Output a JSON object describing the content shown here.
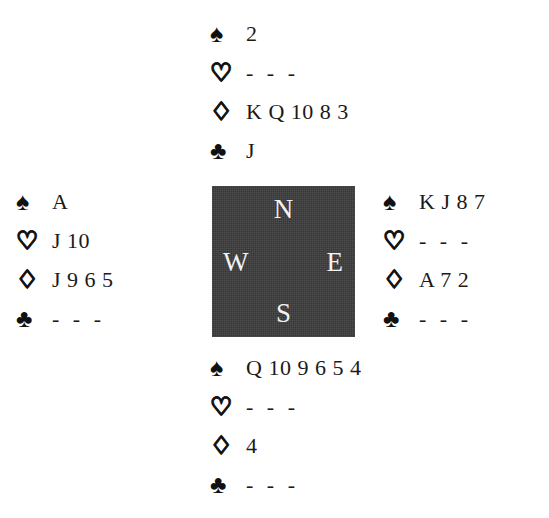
{
  "diagram": {
    "type": "bridge-deal",
    "void_marker": "- - -",
    "box_color": "#3b3b3b",
    "box_text_color": "#f2f2f2",
    "suit_symbols": {
      "spade": "♠",
      "heart": "♡",
      "diamond": "♢",
      "club": "♣"
    }
  },
  "compass": {
    "north": "N",
    "west": "W",
    "east": "E",
    "south": "S"
  },
  "hands": {
    "north": {
      "label": "North",
      "spades": "2",
      "hearts": "- - -",
      "diamonds": "K Q 10 8 3",
      "clubs": "J"
    },
    "west": {
      "label": "West",
      "spades": "A",
      "hearts": "J 10",
      "diamonds": "J 9 6 5",
      "clubs": "- - -"
    },
    "east": {
      "label": "East",
      "spades": "K J 8 7",
      "hearts": "- - -",
      "diamonds": "A 7 2",
      "clubs": "- - -"
    },
    "south": {
      "label": "South",
      "spades": "Q 10 9 6 5 4",
      "hearts": "- - -",
      "diamonds": "4",
      "clubs": "- - -"
    }
  }
}
